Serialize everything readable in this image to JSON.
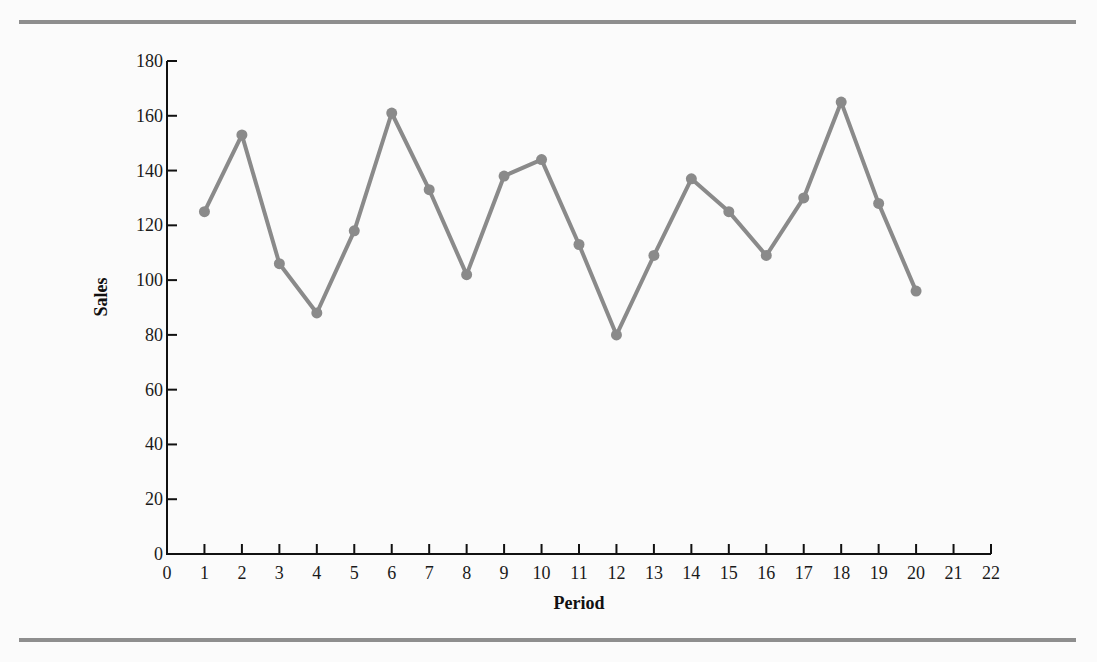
{
  "chart_data": {
    "type": "line",
    "title": "",
    "xlabel": "Period",
    "ylabel": "Sales",
    "xlim": [
      0,
      22
    ],
    "ylim": [
      0,
      180
    ],
    "x_ticks": [
      0,
      1,
      2,
      3,
      4,
      5,
      6,
      7,
      8,
      9,
      10,
      11,
      12,
      13,
      14,
      15,
      16,
      17,
      18,
      19,
      20,
      21,
      22
    ],
    "y_ticks": [
      0,
      20,
      40,
      60,
      80,
      100,
      120,
      140,
      160,
      180
    ],
    "grid": false,
    "legend": null,
    "series": [
      {
        "name": "Sales",
        "color": "#8a8a8a",
        "marker": "circle",
        "x": [
          1,
          2,
          3,
          4,
          5,
          6,
          7,
          8,
          9,
          10,
          11,
          12,
          13,
          14,
          15,
          16,
          17,
          18,
          19,
          20
        ],
        "values": [
          125,
          153,
          106,
          88,
          118,
          161,
          133,
          102,
          138,
          144,
          113,
          80,
          109,
          137,
          125,
          109,
          130,
          165,
          128,
          96
        ]
      }
    ]
  },
  "labels": {
    "xlabel": "Period",
    "ylabel": "Sales"
  }
}
